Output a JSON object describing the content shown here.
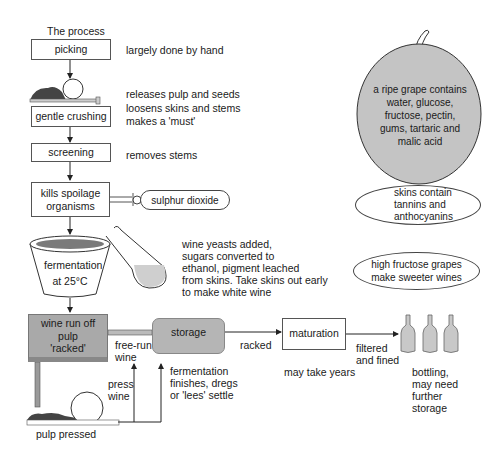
{
  "title": "The process",
  "steps": {
    "picking": {
      "label": "picking",
      "note": "largely done by hand"
    },
    "crushing": {
      "label": "gentle crushing",
      "note": "releases pulp and seeds\nloosens skins and stems\nmakes a 'must'"
    },
    "screening": {
      "label": "screening",
      "note": "removes stems"
    },
    "sulphuring": {
      "label": "kills spoilage\norganisms",
      "additive": "sulphur dioxide"
    },
    "fermentation": {
      "label": "fermentation\nat 25°C",
      "note": "wine yeasts added,\nsugars converted to\nethanol, pigment leached\nfrom skins. Take skins out early\nto make white wine"
    },
    "racking": {
      "label": "wine run off\npulp\n'racked'"
    },
    "storage": {
      "label": "storage",
      "note": "fermentation\nfinishes, dregs\nor 'lees' settle"
    },
    "maturation": {
      "label": "maturation",
      "note": "may take years"
    },
    "bottling": {
      "note": "bottling,\nmay need\nfurther\nstorage"
    },
    "pressing": {
      "label": "pulp pressed"
    }
  },
  "flow_labels": {
    "free_run": "free-run\nwine",
    "press_wine": "press\nwine",
    "racked": "racked",
    "filtered": "filtered\nand fined"
  },
  "facts": {
    "grape": "a ripe grape contains\nwater, glucose,\nfructose, pectin,\ngums, tartaric and\nmalic acid",
    "skins": "skins contain\ntannins and\nanthocyanins",
    "fructose": "high fructose grapes\nmake sweeter wines"
  },
  "colors": {
    "grape_fill": "#c4c4c4",
    "racking_fill": "#a9a9a9",
    "storage_fill": "#b5b5b5",
    "bottle_fill": "#c8c8c8",
    "wine_fill": "#7a7a7a",
    "line": "#222222"
  }
}
